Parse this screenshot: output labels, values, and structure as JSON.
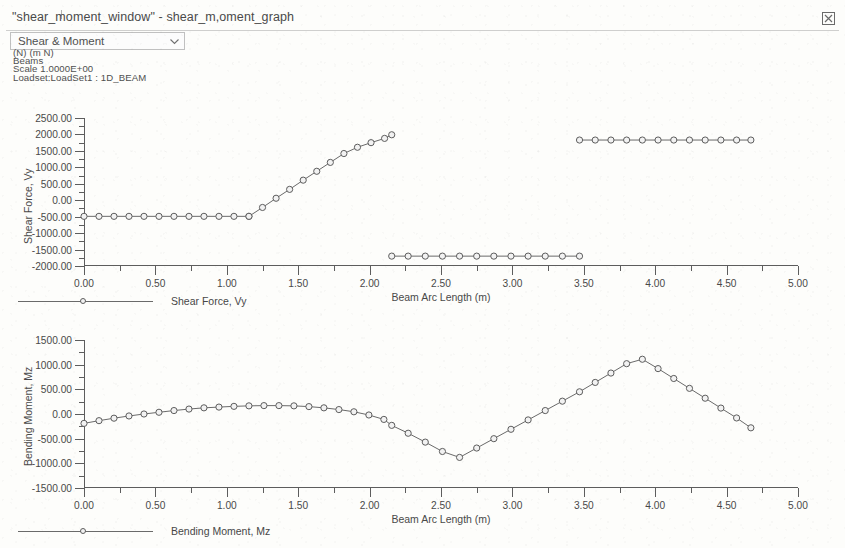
{
  "window": {
    "title": "\"shear_moment_window\" - shear_m,oment_graph",
    "close_icon": "close-icon"
  },
  "toolbar": {
    "view_select": {
      "value": "Shear & Moment",
      "arrow_icon": "chevron-down-icon",
      "options": [
        "Shear & Moment"
      ]
    }
  },
  "meta": {
    "units": "(N)  (m N)",
    "entity": "Beams",
    "scale": "Scale  1.0000E+00",
    "loadset": "Loadset:LoadSet1 :  1D_BEAM"
  },
  "colors": {
    "axis": "#5d5d5d",
    "curve": "#6a6a6a",
    "marker_fill": "#f2f2f2",
    "text": "#494949",
    "page_bg": "#fdfdfb"
  },
  "chart_data": [
    {
      "id": "shear-force-chart",
      "type": "line",
      "title": "",
      "xlabel": "Beam Arc Length (m)",
      "ylabel": "Shear Force, Vy",
      "legend": "Shear Force, Vy",
      "legend_position": "below-left",
      "xlim": [
        0.0,
        5.0
      ],
      "ylim": [
        -2000.0,
        2500.0
      ],
      "xticks": [
        0.0,
        0.5,
        1.0,
        1.5,
        2.0,
        2.5,
        3.0,
        3.5,
        4.0,
        4.5,
        5.0
      ],
      "xtick_labels": [
        "0.00",
        "0.50",
        "1.00",
        "1.50",
        "2.00",
        "2.50",
        "3.00",
        "3.50",
        "4.00",
        "4.50",
        "5.00"
      ],
      "yticks": [
        -2000,
        -1500,
        -1000,
        -500,
        0,
        500,
        1000,
        1500,
        2000,
        2500
      ],
      "ytick_labels": [
        "-2000.00",
        "-1500.00",
        "-1000.00",
        "-500.00",
        "0.00",
        "500.00",
        "1000.00",
        "1500.00",
        "2000.00",
        "2500.00"
      ],
      "grid": false,
      "segments": [
        {
          "name": "span-1-constant-negative-shear",
          "x": [
            0.0,
            0.105,
            0.21,
            0.315,
            0.42,
            0.525,
            0.63,
            0.735,
            0.84,
            0.945,
            1.05,
            1.155
          ],
          "y": [
            -490,
            -490,
            -490,
            -490,
            -490,
            -490,
            -490,
            -490,
            -490,
            -490,
            -490,
            -490
          ]
        },
        {
          "name": "span-1-ramp-up",
          "x": [
            1.155,
            1.25,
            1.345,
            1.44,
            1.535,
            1.63,
            1.725,
            1.82,
            1.915,
            2.01,
            2.105,
            2.155
          ],
          "y": [
            -490,
            -220,
            60,
            330,
            610,
            880,
            1150,
            1420,
            1610,
            1750,
            1880,
            1990
          ]
        },
        {
          "name": "span-2-constant-negative-shear",
          "x": [
            2.155,
            2.27,
            2.39,
            2.51,
            2.63,
            2.75,
            2.87,
            2.99,
            3.11,
            3.23,
            3.35,
            3.47
          ],
          "y": [
            -1700,
            -1700,
            -1700,
            -1700,
            -1700,
            -1700,
            -1700,
            -1700,
            -1700,
            -1700,
            -1700,
            -1700
          ]
        },
        {
          "name": "span-3-constant-positive-shear",
          "x": [
            3.47,
            3.58,
            3.69,
            3.8,
            3.91,
            4.02,
            4.13,
            4.24,
            4.35,
            4.46,
            4.57,
            4.67
          ],
          "y": [
            1830,
            1830,
            1830,
            1830,
            1830,
            1830,
            1830,
            1830,
            1830,
            1830,
            1830,
            1830
          ]
        }
      ]
    },
    {
      "id": "bending-moment-chart",
      "type": "line",
      "title": "",
      "xlabel": "Beam Arc Length (m)",
      "ylabel": "Bending Moment, Mz",
      "legend": "Bending Moment, Mz",
      "legend_position": "below-left",
      "xlim": [
        0.0,
        5.0
      ],
      "ylim": [
        -1500.0,
        1500.0
      ],
      "xticks": [
        0.0,
        0.5,
        1.0,
        1.5,
        2.0,
        2.5,
        3.0,
        3.5,
        4.0,
        4.5,
        5.0
      ],
      "xtick_labels": [
        "0.00",
        "0.50",
        "1.00",
        "1.50",
        "2.00",
        "2.50",
        "3.00",
        "3.50",
        "4.00",
        "4.50",
        "5.00"
      ],
      "yticks": [
        -1500,
        -1000,
        -500,
        0,
        500,
        1000,
        1500
      ],
      "ytick_labels": [
        "-1500.00",
        "-1000.00",
        "-500.00",
        "0.00",
        "500.00",
        "1000.00",
        "1500.00"
      ],
      "grid": false,
      "segments": [
        {
          "name": "moment-curve",
          "x": [
            0.0,
            0.105,
            0.21,
            0.315,
            0.42,
            0.525,
            0.63,
            0.735,
            0.84,
            0.945,
            1.05,
            1.155,
            1.26,
            1.365,
            1.47,
            1.575,
            1.68,
            1.785,
            1.89,
            1.995,
            2.1,
            2.155,
            2.27,
            2.39,
            2.51,
            2.63,
            2.75,
            2.87,
            2.99,
            3.11,
            3.23,
            3.35,
            3.47,
            3.58,
            3.69,
            3.8,
            3.91,
            4.02,
            4.13,
            4.24,
            4.35,
            4.46,
            4.57,
            4.67
          ],
          "y": [
            -190,
            -135,
            -85,
            -40,
            0,
            35,
            70,
            100,
            125,
            140,
            155,
            165,
            170,
            170,
            165,
            150,
            125,
            90,
            45,
            -20,
            -110,
            -230,
            -390,
            -570,
            -760,
            -880,
            -690,
            -500,
            -310,
            -120,
            70,
            260,
            450,
            640,
            830,
            1020,
            1110,
            920,
            720,
            520,
            320,
            120,
            -80,
            -280
          ]
        }
      ]
    }
  ]
}
